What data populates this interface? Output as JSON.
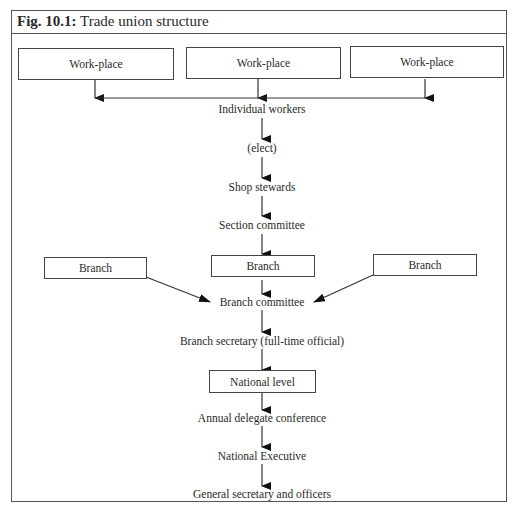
{
  "figure": {
    "number": "Fig. 10.1:",
    "title": "Trade union structure"
  },
  "diagram": {
    "type": "hierarchy-flowchart",
    "workplaces": [
      "Work-place",
      "Work-place",
      "Work-place"
    ],
    "chain": [
      {
        "label": "Individual workers",
        "boxed": false
      },
      {
        "label": "(elect)",
        "boxed": false
      },
      {
        "label": "Shop stewards",
        "boxed": false
      },
      {
        "label": "Section committee",
        "boxed": false
      }
    ],
    "branches": [
      "Branch",
      "Branch",
      "Branch"
    ],
    "chain2": [
      {
        "label": "Branch committee",
        "boxed": false
      },
      {
        "label": "Branch secretary (full-time official)",
        "boxed": false
      },
      {
        "label": "National level",
        "boxed": true
      },
      {
        "label": "Annual delegate conference",
        "boxed": false
      },
      {
        "label": "National Executive",
        "boxed": false
      },
      {
        "label": "General secretary and officers",
        "boxed": false
      }
    ],
    "colors": {
      "line": "#444444",
      "text": "#2a2a2a",
      "background": "#ffffff"
    }
  }
}
